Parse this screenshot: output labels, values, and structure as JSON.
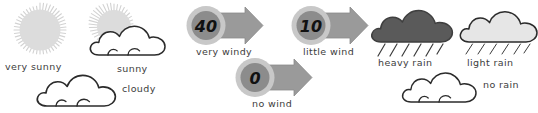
{
  "palette": {
    "sun_fill": "#dcdcdc",
    "sun_ray": "#d0d0d0",
    "cloud_white_fill": "#ffffff",
    "cloud_outline": "#2b2b2b",
    "cloud_heavy_fill": "#5a5a5a",
    "cloud_light_fill": "#e6e6e6",
    "wind_disc_fill": "#8c8c8c",
    "wind_ring_fill": "#c8c8c8",
    "wind_arrow_fill": "#9a9a9a",
    "rain_streak": "#3c3c3c",
    "label_color": "#3c3c3c",
    "background": "#ffffff"
  },
  "groups": [
    {
      "name": "sunshine",
      "label": "Sunshine symbols"
    },
    {
      "name": "wind",
      "label": "Wind symbols"
    },
    {
      "name": "rain",
      "label": "Rain symbols"
    }
  ],
  "symbols": [
    {
      "id": "very-sunny",
      "group": "sunshine",
      "icon": "sun-icon",
      "label": "very sunny",
      "value": null,
      "fill": "#dcdcdc"
    },
    {
      "id": "sunny",
      "group": "sunshine",
      "icon": "sun-behind-cloud-icon",
      "label": "sunny",
      "value": null,
      "fill": "#dcdcdc"
    },
    {
      "id": "cloudy",
      "group": "sunshine",
      "icon": "cloud-icon",
      "label": "cloudy",
      "value": null,
      "fill": "#ffffff"
    },
    {
      "id": "very-windy",
      "group": "wind",
      "icon": "wind-arrow-icon",
      "label": "very windy",
      "value": "40",
      "fill": "#8c8c8c"
    },
    {
      "id": "little-wind",
      "group": "wind",
      "icon": "wind-arrow-icon",
      "label": "little wind",
      "value": "10",
      "fill": "#8c8c8c"
    },
    {
      "id": "no-wind",
      "group": "wind",
      "icon": "wind-arrow-icon",
      "label": "no wind",
      "value": "0",
      "fill": "#8c8c8c"
    },
    {
      "id": "heavy-rain",
      "group": "rain",
      "icon": "rain-cloud-icon",
      "label": "heavy rain",
      "value": null,
      "fill": "#5a5a5a"
    },
    {
      "id": "light-rain",
      "group": "rain",
      "icon": "rain-cloud-icon",
      "label": "light rain",
      "value": null,
      "fill": "#e6e6e6"
    },
    {
      "id": "no-rain",
      "group": "rain",
      "icon": "cloud-icon",
      "label": "no rain",
      "value": null,
      "fill": "#ffffff"
    }
  ]
}
